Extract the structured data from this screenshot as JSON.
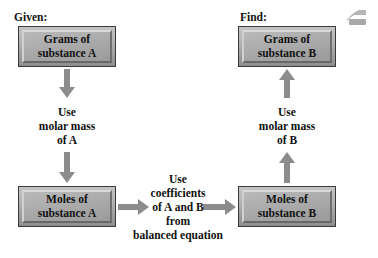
{
  "diagram": {
    "captions": {
      "given": "Given:",
      "find": "Find:"
    },
    "boxes": [
      {
        "id": "grams-a",
        "line1": "Grams of",
        "line2": "substance A"
      },
      {
        "id": "grams-b",
        "line1": "Grams of",
        "line2": "substance B"
      },
      {
        "id": "moles-a",
        "line1": "Moles of",
        "line2": "substance A"
      },
      {
        "id": "moles-b",
        "line1": "Moles of",
        "line2": "substance B"
      }
    ],
    "labels": {
      "molar_mass_a": {
        "line1": "Use",
        "line2": "molar mass",
        "line3": "of A"
      },
      "molar_mass_b": {
        "line1": "Use",
        "line2": "molar mass",
        "line3": "of B"
      },
      "coefficients": {
        "line1": "Use",
        "line2": "coefficients",
        "line3": "of A and B",
        "line4": "from",
        "line5": "balanced equation"
      }
    },
    "arrows": [
      {
        "id": "grams-a-to-molar-a",
        "direction": "down"
      },
      {
        "id": "molar-a-to-moles-a",
        "direction": "down"
      },
      {
        "id": "moles-a-to-coefficients",
        "direction": "right"
      },
      {
        "id": "coefficients-to-moles-b",
        "direction": "right"
      },
      {
        "id": "moles-b-to-molar-b",
        "direction": "up"
      },
      {
        "id": "molar-b-to-grams-b",
        "direction": "up"
      }
    ],
    "colors": {
      "box_fill": "#ababab",
      "box_border": "#3b3b3b",
      "bevel_light": "#d8d8d8",
      "bevel_dark": "#686868",
      "arrow": "#8c8c8c",
      "text": "#111111",
      "background": "#ffffff"
    },
    "artifact_icon": "scan-artifact-icon"
  }
}
